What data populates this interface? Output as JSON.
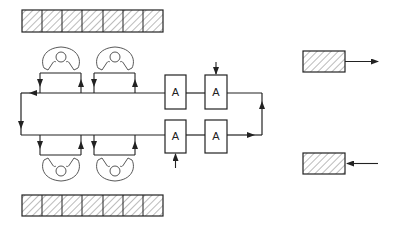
{
  "diagram": {
    "type": "production-line-layout",
    "stations": [
      {
        "id": "A1",
        "label": "A"
      },
      {
        "id": "A2",
        "label": "A"
      },
      {
        "id": "A3",
        "label": "A"
      },
      {
        "id": "A4",
        "label": "A"
      }
    ],
    "storage_top_cells": 7,
    "storage_bottom_cells": 7,
    "workers_top": 2,
    "workers_bottom": 2,
    "output_buffer": {
      "direction": "out"
    },
    "input_buffer": {
      "direction": "in"
    },
    "colors": {
      "line": "#222222",
      "background": "#ffffff"
    }
  }
}
